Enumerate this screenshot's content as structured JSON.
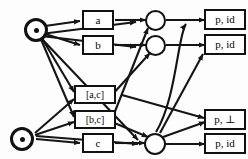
{
  "diagram": {
    "background_color": "#fdfdfd",
    "line_color": "#151515",
    "nodes": {
      "sources": [
        {
          "id": "src-top",
          "label": "",
          "marker": "filled-dot",
          "x": 24,
          "y": 30
        },
        {
          "id": "src-bottom",
          "label": "",
          "marker": "filled-dot",
          "x": 22,
          "y": 139
        }
      ],
      "input_boxes": [
        {
          "id": "box-a",
          "label": "a",
          "x": 97,
          "y": 20
        },
        {
          "id": "box-b",
          "label": "b",
          "x": 97,
          "y": 45
        },
        {
          "id": "box-ac",
          "label": "[a,c]",
          "x": 91,
          "y": 94
        },
        {
          "id": "box-bc",
          "label": "[b,c]",
          "x": 91,
          "y": 119
        },
        {
          "id": "box-c",
          "label": "c",
          "x": 97,
          "y": 143
        }
      ],
      "merge_circles": [
        {
          "id": "circle-1",
          "x": 155,
          "y": 20
        },
        {
          "id": "circle-2",
          "x": 155,
          "y": 45
        },
        {
          "id": "circle-3",
          "x": 155,
          "y": 143
        }
      ],
      "output_boxes": [
        {
          "id": "out-1",
          "label": "p, id",
          "x": 222,
          "y": 20
        },
        {
          "id": "out-2",
          "label": "p, id",
          "x": 222,
          "y": 45
        },
        {
          "id": "out-3",
          "label": "p, ⊥",
          "x": 222,
          "y": 119
        },
        {
          "id": "out-4",
          "label": "p, id",
          "x": 222,
          "y": 143
        }
      ]
    },
    "edge_count": 22
  }
}
